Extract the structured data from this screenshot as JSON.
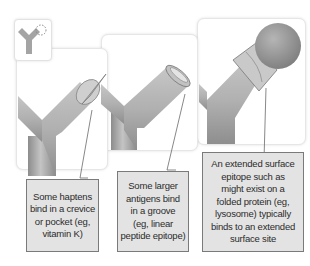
{
  "figure": {
    "icon": "antibody-y-icon",
    "panels": [
      {
        "id": "crevice",
        "icon": "hapten-cone-icon",
        "caption": "Some haptens\nbind in a crevice\nor pocket (eg,\nvitamin K)"
      },
      {
        "id": "groove",
        "icon": "groove-cylinder-icon",
        "caption": "Some larger\nantigens bind\nin a groove\n(eg, linear\npeptide epitope)"
      },
      {
        "id": "surface",
        "icon": "sphere-protein-icon",
        "caption": "An extended surface\nepitope such as\nmight exist on a\nfolded protein (eg,\nlysosome) typically\nbinds to an extended\nsurface site"
      }
    ],
    "colors": {
      "callout_fill": "#e3e3e3",
      "callout_border": "#7a7a7a",
      "antibody_gray": "#a8a8a8",
      "panel_border": "#e6e6e6"
    }
  }
}
